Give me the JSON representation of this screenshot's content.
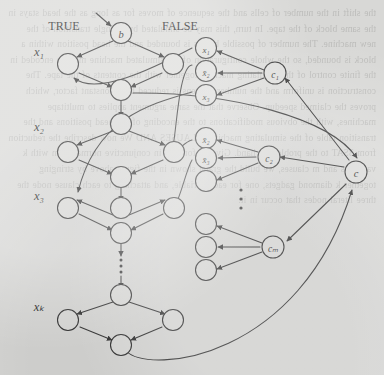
{
  "figure": {
    "ink_color": "#2b2b2b",
    "node_fill": "#dcdcda",
    "background_color": "#d8d8d6",
    "labels": {
      "true": "TRUE",
      "false": "FALSE",
      "start_node": "b",
      "hub_node": "c"
    },
    "variable_rows": [
      {
        "label": "x₁",
        "y": 52
      },
      {
        "label": "x₂",
        "y": 127
      },
      {
        "label": "x₃",
        "y": 196
      },
      {
        "label": "xₖ",
        "y": 307
      }
    ],
    "vertical_ellipsis_left": "⋮",
    "vertical_ellipsis_right": "⋮",
    "clauses": [
      {
        "node": "c₁",
        "literals": [
          "x₁",
          "x̄₂",
          "x₃"
        ],
        "literal_bars": [
          false,
          true,
          false
        ]
      },
      {
        "node": "c₂",
        "literals": [
          "x̄₂",
          "x̄₃",
          ""
        ],
        "literal_bars": [
          true,
          true,
          false
        ]
      },
      {
        "node": "cₘ",
        "literals": [
          "",
          "",
          ""
        ],
        "literal_bars": [
          false,
          false,
          false
        ]
      }
    ]
  },
  "bleed_text": "the shift in the number of cells and the sequence of moves for as long as the head stays in the same block of the tape. In turn, this may be simulated by a single transition of the new machine. The number of possible blocks is bounded and the head position within a block is bounded, so the whole configuration of the simulated machine may be encoded in the finite control of the simulating machine together with the contents of the tape. The construction is uniform and the number of steps is reduced by a constant factor, which proves the claimed speedup. Observe that the same argument applies to multitape machines, with the obvious modifications to the encoding of the head positions and the transition table of the simulating machine. CLAUSES AND We now describe the reduction from 3SAT to the problem at hand. Given a formula in conjunctive normal form with k variables and m clauses, we build the graph shown in the figure above by stringing together k diamond gadgets, one for each variable, and attaching to each clause node the three literal nodes that occur in it."
}
